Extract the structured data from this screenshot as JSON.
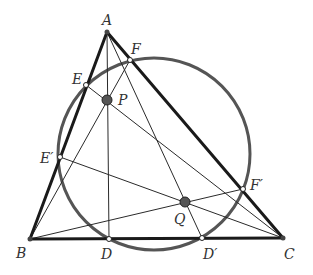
{
  "diagram": {
    "type": "geometry",
    "colors": {
      "triangle": "#1a1a1a",
      "circle": "#555555",
      "cevian": "#2a2a2a",
      "special_point_fill": "#555555",
      "foot_point_fill": "#ffffff",
      "label": "#333333"
    },
    "points": {
      "A": {
        "label": "A",
        "x": 107,
        "y": 32
      },
      "B": {
        "label": "B",
        "x": 30,
        "y": 239
      },
      "C": {
        "label": "C",
        "x": 283,
        "y": 238
      },
      "D": {
        "label": "D",
        "x": 109,
        "y": 239
      },
      "D2": {
        "label": "D′",
        "x": 202,
        "y": 238
      },
      "E": {
        "label": "E",
        "x": 86,
        "y": 85
      },
      "E2": {
        "label": "E′",
        "x": 60,
        "y": 157
      },
      "F": {
        "label": "F",
        "x": 130,
        "y": 60
      },
      "F2": {
        "label": "F′",
        "x": 243,
        "y": 189
      },
      "P": {
        "label": "P",
        "x": 107,
        "y": 100
      },
      "Q": {
        "label": "Q",
        "x": 185,
        "y": 202
      }
    },
    "circle": {
      "cx": 154,
      "cy": 154,
      "r": 96
    },
    "segments_triangle": [
      [
        "A",
        "B"
      ],
      [
        "B",
        "C"
      ],
      [
        "C",
        "A"
      ]
    ],
    "segments_cevians": [
      [
        "A",
        "D"
      ],
      [
        "A",
        "D2"
      ],
      [
        "B",
        "F"
      ],
      [
        "B",
        "F2"
      ],
      [
        "C",
        "E"
      ],
      [
        "C",
        "E2"
      ]
    ],
    "labels": {
      "A": "A",
      "B": "B",
      "C": "C",
      "D": "D",
      "D2": "D′",
      "E": "E",
      "E2": "E′",
      "F": "F",
      "F2": "F′",
      "P": "P",
      "Q": "Q"
    }
  }
}
